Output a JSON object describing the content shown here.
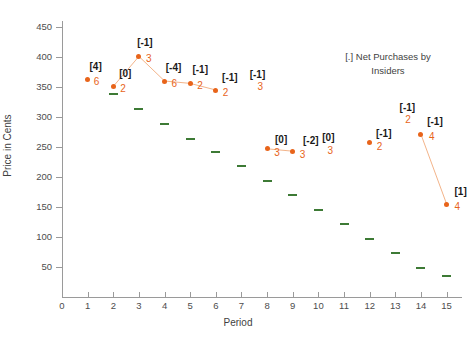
{
  "chart_data": {
    "type": "scatter",
    "title": "",
    "xlabel": "Period",
    "ylabel": "Price in Cents",
    "xlim": [
      0,
      15.6
    ],
    "ylim": [
      0,
      460
    ],
    "xticks": [
      0,
      1,
      2,
      3,
      4,
      5,
      6,
      7,
      8,
      9,
      10,
      11,
      12,
      13,
      14,
      15
    ],
    "yticks": [
      50,
      100,
      150,
      200,
      250,
      300,
      350,
      400,
      450
    ],
    "grid": false,
    "legend": {
      "position": "upper-right",
      "text_line1": "[.] Net Purchases by",
      "text_line2": "Insiders"
    },
    "series": [
      {
        "name": "Price in Cents",
        "marker": "circle",
        "color": "#e8641a",
        "x": [
          1,
          2,
          3,
          4,
          5,
          6,
          7,
          8,
          9,
          10,
          11,
          12,
          13,
          14,
          15
        ],
        "values": [
          362,
          351,
          401,
          360,
          356,
          345,
          null,
          247,
          243,
          null,
          null,
          257,
          null,
          271,
          155
        ],
        "annotations_bracket": [
          "[4]",
          "[0]",
          "[-1]",
          "[-4]",
          "[-1]",
          "[-1]",
          "[-1]",
          "[0]",
          "[-2]",
          "[0]",
          null,
          "[-1]",
          "[-1]",
          "[-1]",
          "[1]"
        ],
        "annotations_count": [
          "6",
          "2",
          "3",
          "6",
          "2",
          "2",
          "3",
          "3",
          "3",
          "3",
          null,
          "2",
          "2",
          "4",
          "4"
        ]
      },
      {
        "name": "Reference dashes",
        "marker": "dash",
        "color": "#3d7a35",
        "x": [
          2,
          3,
          4,
          5,
          6,
          7,
          8,
          9,
          10,
          11,
          12,
          13,
          14,
          15
        ],
        "values": [
          338,
          313,
          289,
          263,
          241,
          218,
          194,
          170,
          145,
          122,
          97,
          73,
          49,
          35
        ]
      }
    ],
    "connector_segments": [
      [
        2,
        3
      ],
      [
        3,
        4
      ],
      [
        4,
        5
      ],
      [
        5,
        6
      ],
      [
        6,
        7
      ],
      [
        7,
        8
      ],
      [
        8,
        9
      ],
      [
        14,
        15
      ]
    ]
  },
  "axis": {
    "ylabel": "Price in Cents",
    "xlabel": "Period",
    "ytick_labels": [
      "450",
      "400",
      "350",
      "300",
      "250",
      "200",
      "150",
      "100",
      "50"
    ],
    "xtick_labels": [
      "0",
      "1",
      "2",
      "3",
      "4",
      "5",
      "6",
      "7",
      "8",
      "9",
      "10",
      "11",
      "12",
      "13",
      "14",
      "15"
    ]
  },
  "colors": {
    "orange": "#e8641a",
    "green": "#3d7a35",
    "axis": "#9a9a9a",
    "text": "#3f3f3f",
    "bracket": "#1a1a1a",
    "connector": "#f3b48a"
  }
}
